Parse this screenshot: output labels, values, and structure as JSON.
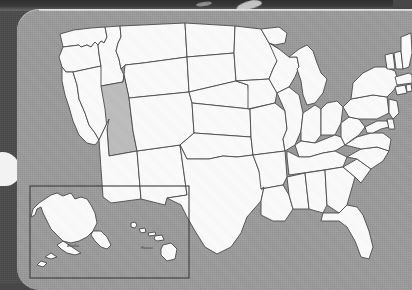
{
  "image": {
    "kind": "photographed-map",
    "subject": "United States map",
    "panel_color": "#9c9c9c",
    "backdrop_color": "#4b4b4b",
    "state_fill": "#fbfbfb",
    "state_border": "#4a4a4a",
    "highlight_color": "#bdbdbd"
  },
  "map": {
    "title": "United States",
    "highlighted_state": "Utah",
    "inset": {
      "alaska_label": "Alaska",
      "hawaii_label": "Hawaii"
    }
  },
  "states": [
    {
      "code": "WA",
      "name": "Washington",
      "highlighted": false
    },
    {
      "code": "OR",
      "name": "Oregon",
      "highlighted": false
    },
    {
      "code": "CA",
      "name": "California",
      "highlighted": false
    },
    {
      "code": "NV",
      "name": "Nevada",
      "highlighted": false
    },
    {
      "code": "ID",
      "name": "Idaho",
      "highlighted": false
    },
    {
      "code": "MT",
      "name": "Montana",
      "highlighted": false
    },
    {
      "code": "WY",
      "name": "Wyoming",
      "highlighted": false
    },
    {
      "code": "UT",
      "name": "Utah",
      "highlighted": true
    },
    {
      "code": "AZ",
      "name": "Arizona",
      "highlighted": false
    },
    {
      "code": "NM",
      "name": "New Mexico",
      "highlighted": false
    },
    {
      "code": "CO",
      "name": "Colorado",
      "highlighted": false
    },
    {
      "code": "ND",
      "name": "North Dakota",
      "highlighted": false
    },
    {
      "code": "SD",
      "name": "South Dakota",
      "highlighted": false
    },
    {
      "code": "NE",
      "name": "Nebraska",
      "highlighted": false
    },
    {
      "code": "KS",
      "name": "Kansas",
      "highlighted": false
    },
    {
      "code": "OK",
      "name": "Oklahoma",
      "highlighted": false
    },
    {
      "code": "TX",
      "name": "Texas",
      "highlighted": false
    },
    {
      "code": "MN",
      "name": "Minnesota",
      "highlighted": false
    },
    {
      "code": "IA",
      "name": "Iowa",
      "highlighted": false
    },
    {
      "code": "MO",
      "name": "Missouri",
      "highlighted": false
    },
    {
      "code": "AR",
      "name": "Arkansas",
      "highlighted": false
    },
    {
      "code": "LA",
      "name": "Louisiana",
      "highlighted": false
    },
    {
      "code": "WI",
      "name": "Wisconsin",
      "highlighted": false
    },
    {
      "code": "IL",
      "name": "Illinois",
      "highlighted": false
    },
    {
      "code": "MI",
      "name": "Michigan",
      "highlighted": false
    },
    {
      "code": "IN",
      "name": "Indiana",
      "highlighted": false
    },
    {
      "code": "OH",
      "name": "Ohio",
      "highlighted": false
    },
    {
      "code": "KY",
      "name": "Kentucky",
      "highlighted": false
    },
    {
      "code": "TN",
      "name": "Tennessee",
      "highlighted": false
    },
    {
      "code": "MS",
      "name": "Mississippi",
      "highlighted": false
    },
    {
      "code": "AL",
      "name": "Alabama",
      "highlighted": false
    },
    {
      "code": "GA",
      "name": "Georgia",
      "highlighted": false
    },
    {
      "code": "FL",
      "name": "Florida",
      "highlighted": false
    },
    {
      "code": "SC",
      "name": "South Carolina",
      "highlighted": false
    },
    {
      "code": "NC",
      "name": "North Carolina",
      "highlighted": false
    },
    {
      "code": "VA",
      "name": "Virginia",
      "highlighted": false
    },
    {
      "code": "WV",
      "name": "West Virginia",
      "highlighted": false
    },
    {
      "code": "MD",
      "name": "Maryland",
      "highlighted": false
    },
    {
      "code": "DE",
      "name": "Delaware",
      "highlighted": false
    },
    {
      "code": "PA",
      "name": "Pennsylvania",
      "highlighted": false
    },
    {
      "code": "NJ",
      "name": "New Jersey",
      "highlighted": false
    },
    {
      "code": "NY",
      "name": "New York",
      "highlighted": false
    },
    {
      "code": "CT",
      "name": "Connecticut",
      "highlighted": false
    },
    {
      "code": "RI",
      "name": "Rhode Island",
      "highlighted": false
    },
    {
      "code": "MA",
      "name": "Massachusetts",
      "highlighted": false
    },
    {
      "code": "VT",
      "name": "Vermont",
      "highlighted": false
    },
    {
      "code": "NH",
      "name": "New Hampshire",
      "highlighted": false
    },
    {
      "code": "ME",
      "name": "Maine",
      "highlighted": false
    },
    {
      "code": "AK",
      "name": "Alaska",
      "highlighted": false
    },
    {
      "code": "HI",
      "name": "Hawaii",
      "highlighted": false
    }
  ]
}
